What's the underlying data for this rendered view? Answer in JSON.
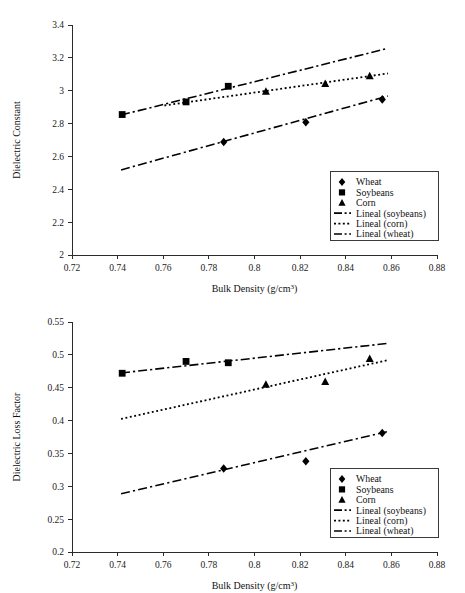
{
  "figure": {
    "panels": [
      {
        "id": "top",
        "ylabel": "Dielectric Constant",
        "xlabel_main": "Bulk Density (g/cm",
        "xlabel_sup": "3",
        "xlabel_tail": ")",
        "y_ticks": [
          "2",
          "2.2",
          "2.4",
          "2.6",
          "2.8",
          "3",
          "3.2",
          "3.4"
        ],
        "x_ticks": [
          "0.72",
          "0.74",
          "0.76",
          "0.78",
          "0.8",
          "0.82",
          "0.84",
          "0.86",
          "0.88"
        ]
      },
      {
        "id": "bottom",
        "ylabel": "Dielectric Loss Factor",
        "xlabel_main": "Bulk Density (g/cm",
        "xlabel_sup": "3",
        "xlabel_tail": ")",
        "y_ticks": [
          "0.2",
          "0.25",
          "0.3",
          "0.35",
          "0.4",
          "0.45",
          "0.5",
          "0.55"
        ],
        "x_ticks": [
          "0.72",
          "0.74",
          "0.76",
          "0.78",
          "0.8",
          "0.82",
          "0.84",
          "0.86",
          "0.88"
        ]
      }
    ],
    "legend": {
      "entries": [
        {
          "label": "Wheat",
          "kind": "marker",
          "glyph": "diamond-marker"
        },
        {
          "label": "Soybeans",
          "kind": "marker",
          "glyph": "square-marker"
        },
        {
          "label": "Corn",
          "kind": "marker",
          "glyph": "triangle-marker"
        },
        {
          "label": "Lineal (soybeans)",
          "kind": "line",
          "glyph": "dash-dot-line"
        },
        {
          "label": "Lineal (corn)",
          "kind": "line",
          "glyph": "dotted-line"
        },
        {
          "label": "Lineal (wheat)",
          "kind": "line",
          "glyph": "dash-dot-line"
        }
      ]
    },
    "colors": {
      "ink": "#000000",
      "axis": "#2b2b2b",
      "legend_border": "#3a3a3a",
      "background": "#ffffff"
    }
  },
  "chart_data": [
    {
      "type": "scatter",
      "panel": "top",
      "title": "",
      "xlabel": "Bulk Density (g/cm3)",
      "ylabel": "Dielectric Constant",
      "xlim": [
        0.72,
        0.88
      ],
      "ylim": [
        2,
        3.4
      ],
      "xticks": [
        0.72,
        0.74,
        0.76,
        0.78,
        0.8,
        0.82,
        0.84,
        0.86,
        0.88
      ],
      "yticks": [
        2,
        2.2,
        2.4,
        2.6,
        2.8,
        3,
        3.2,
        3.4
      ],
      "grid": false,
      "legend_position": "lower-right",
      "series": [
        {
          "name": "Wheat",
          "marker": "diamond",
          "x": [
            0.7865,
            0.8225,
            0.856
          ],
          "y": [
            2.688,
            2.808,
            2.947
          ]
        },
        {
          "name": "Soybeans",
          "marker": "square",
          "x": [
            0.742,
            0.77,
            0.7885
          ],
          "y": [
            2.855,
            2.932,
            3.027
          ]
        },
        {
          "name": "Corn",
          "marker": "triangle",
          "x": [
            0.805,
            0.831,
            0.8505
          ],
          "y": [
            2.995,
            3.043,
            3.09
          ]
        }
      ],
      "trendlines": [
        {
          "name": "Lineal (soybeans)",
          "style": "dash-dot",
          "x": [
            0.7415,
            0.8585
          ],
          "y": [
            2.852,
            3.258
          ]
        },
        {
          "name": "Lineal (corn)",
          "style": "dotted",
          "x": [
            0.7605,
            0.8585
          ],
          "y": [
            2.91,
            3.105
          ]
        },
        {
          "name": "Lineal (wheat)",
          "style": "dash-dot",
          "x": [
            0.7415,
            0.8585
          ],
          "y": [
            2.518,
            2.968
          ]
        }
      ]
    },
    {
      "type": "scatter",
      "panel": "bottom",
      "title": "",
      "xlabel": "Bulk Density (g/cm3)",
      "ylabel": "Dielectric Loss Factor",
      "xlim": [
        0.72,
        0.88
      ],
      "ylim": [
        0.2,
        0.55
      ],
      "xticks": [
        0.72,
        0.74,
        0.76,
        0.78,
        0.8,
        0.82,
        0.84,
        0.86,
        0.88
      ],
      "yticks": [
        0.2,
        0.25,
        0.3,
        0.35,
        0.4,
        0.45,
        0.5,
        0.55
      ],
      "grid": false,
      "legend_position": "lower-right",
      "series": [
        {
          "name": "Wheat",
          "marker": "diamond",
          "x": [
            0.7865,
            0.8225,
            0.856
          ],
          "y": [
            0.327,
            0.338,
            0.381
          ]
        },
        {
          "name": "Soybeans",
          "marker": "square",
          "x": [
            0.742,
            0.77,
            0.7885
          ],
          "y": [
            0.472,
            0.49,
            0.488
          ]
        },
        {
          "name": "Corn",
          "marker": "triangle",
          "x": [
            0.805,
            0.831,
            0.8505
          ],
          "y": [
            0.455,
            0.459,
            0.494
          ]
        }
      ],
      "trendlines": [
        {
          "name": "Lineal (soybeans)",
          "style": "dash-dot",
          "x": [
            0.7415,
            0.8585
          ],
          "y": [
            0.4725,
            0.5175
          ]
        },
        {
          "name": "Lineal (corn)",
          "style": "dotted",
          "x": [
            0.7415,
            0.8585
          ],
          "y": [
            0.4025,
            0.492
          ]
        },
        {
          "name": "Lineal (wheat)",
          "style": "dash-dot",
          "x": [
            0.7415,
            0.8585
          ],
          "y": [
            0.2885,
            0.3835
          ]
        }
      ]
    }
  ]
}
